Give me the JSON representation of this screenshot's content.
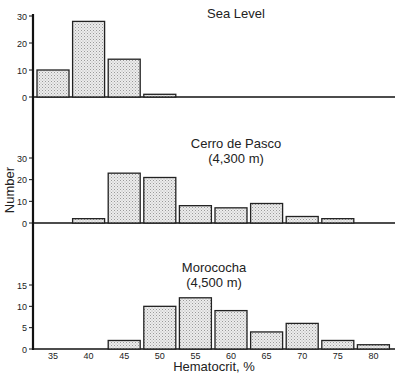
{
  "chart_data": [
    {
      "type": "bar",
      "title": "Sea Level",
      "subtitle": "",
      "xlabel": "Hematocrit, %",
      "ylabel": "Number",
      "categories": [
        "35",
        "40",
        "45",
        "50",
        "55",
        "60",
        "65",
        "70",
        "75",
        "80"
      ],
      "values": [
        10,
        28,
        14,
        1,
        0,
        0,
        0,
        0,
        0,
        0
      ],
      "yticks": [
        0,
        10,
        20,
        30
      ],
      "ylim": [
        0,
        30
      ],
      "grid": false
    },
    {
      "type": "bar",
      "title": "Cerro de Pasco",
      "subtitle": "(4,300 m)",
      "xlabel": "Hematocrit, %",
      "ylabel": "Number",
      "categories": [
        "35",
        "40",
        "45",
        "50",
        "55",
        "60",
        "65",
        "70",
        "75",
        "80"
      ],
      "values": [
        0,
        2,
        23,
        21,
        8,
        7,
        9,
        3,
        2,
        0
      ],
      "yticks": [
        0,
        10,
        20,
        30
      ],
      "ylim": [
        0,
        30
      ],
      "grid": false
    },
    {
      "type": "bar",
      "title": "Morococha",
      "subtitle": "(4,500 m)",
      "xlabel": "Hematocrit, %",
      "ylabel": "Number",
      "categories": [
        "35",
        "40",
        "45",
        "50",
        "55",
        "60",
        "65",
        "70",
        "75",
        "80"
      ],
      "values": [
        0,
        0,
        2,
        10,
        12,
        9,
        4,
        6,
        2,
        1
      ],
      "yticks": [
        0,
        5,
        10,
        15
      ],
      "ylim": [
        0,
        15
      ],
      "grid": false
    }
  ],
  "axes": {
    "xlabel": "Hematocrit, %",
    "ylabel": "Number",
    "xticks": [
      "35",
      "40",
      "45",
      "50",
      "55",
      "60",
      "65",
      "70",
      "75",
      "80"
    ]
  },
  "colors": {
    "bar_fill": "#e6e6e6",
    "bar_stroke": "#222222",
    "axis": "#111111"
  }
}
